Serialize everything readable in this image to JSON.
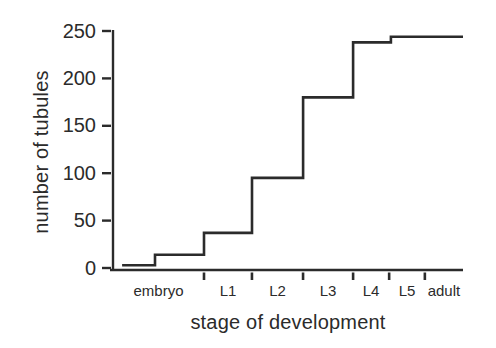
{
  "figure": {
    "background": "#ffffff",
    "line_color": "#2b2b2b",
    "text_color": "#2b2b2b"
  },
  "chart_data": {
    "type": "line",
    "subtype": "step",
    "title": "",
    "xlabel": "stage of development",
    "ylabel": "number of tubules",
    "x_categories": [
      "embryo",
      "L1",
      "L2",
      "L3",
      "L4",
      "L5",
      "adult"
    ],
    "category_boundaries_frac": [
      0,
      0.26,
      0.397,
      0.543,
      0.686,
      0.789,
      0.891,
      1
    ],
    "y_ticks": [
      0,
      50,
      100,
      150,
      200,
      250
    ],
    "ylim": [
      0,
      250
    ],
    "grid": false,
    "legend": null,
    "values_by_stage": {
      "embryo": [
        3,
        14
      ],
      "L1": 37,
      "L2": 95,
      "L3": 180,
      "L4": 238,
      "L5": 244,
      "adult": 244
    },
    "step_points": [
      {
        "x": 0.026,
        "y": 3
      },
      {
        "x": 0.12,
        "y": 3
      },
      {
        "x": 0.12,
        "y": 14
      },
      {
        "x": 0.26,
        "y": 14
      },
      {
        "x": 0.26,
        "y": 37
      },
      {
        "x": 0.397,
        "y": 37
      },
      {
        "x": 0.397,
        "y": 95
      },
      {
        "x": 0.543,
        "y": 95
      },
      {
        "x": 0.543,
        "y": 180
      },
      {
        "x": 0.686,
        "y": 180
      },
      {
        "x": 0.686,
        "y": 238
      },
      {
        "x": 0.794,
        "y": 238
      },
      {
        "x": 0.794,
        "y": 244
      },
      {
        "x": 1.0,
        "y": 244
      }
    ]
  }
}
